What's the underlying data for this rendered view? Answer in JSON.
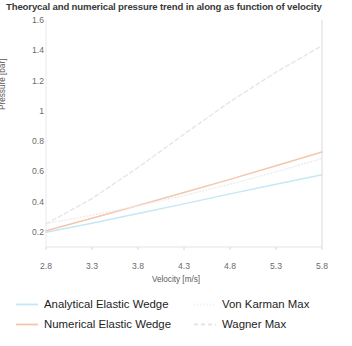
{
  "chart_data": {
    "type": "line",
    "title": "Theorycal and numerical pressure trend in along as function of velocity",
    "xlabel": "Velocity [m/s]",
    "ylabel": "Pressure [bar]",
    "xlim": [
      2.8,
      5.8
    ],
    "ylim": [
      0.1,
      1.6
    ],
    "xticks": [
      "2.8",
      "3.3",
      "3.8",
      "4.3",
      "4.8",
      "5.3",
      "5.8"
    ],
    "xtick_values": [
      2.8,
      3.3,
      3.8,
      4.3,
      4.8,
      5.3,
      5.8
    ],
    "yticks": [
      "0.2",
      "0.4",
      "0.6",
      "0.8",
      "1",
      "1.2",
      "1.4",
      "1.6"
    ],
    "ytick_values": [
      0.2,
      0.4,
      0.6,
      0.8,
      1.0,
      1.2,
      1.4,
      1.6
    ],
    "grid": false,
    "legend_position": "bottom",
    "x": [
      2.8,
      3.3,
      3.8,
      4.3,
      4.8,
      5.3,
      5.8
    ],
    "series": [
      {
        "name": "Analytical Elastic Wedge",
        "color": "#c6e7f5",
        "style": "solid",
        "values": [
          0.197,
          0.257,
          0.321,
          0.385,
          0.451,
          0.515,
          0.578
        ]
      },
      {
        "name": "Numerical Elastic Wedge",
        "color": "#f3c7ad",
        "style": "solid",
        "values": [
          0.208,
          0.29,
          0.374,
          0.46,
          0.547,
          0.637,
          0.728
        ]
      },
      {
        "name": "Von Karman Max",
        "color": "#ededed",
        "style": "dotted",
        "values": [
          0.255,
          0.31,
          0.372,
          0.44,
          0.515,
          0.597,
          0.685
        ]
      },
      {
        "name": "Wagner Max",
        "color": "#e6e6e6",
        "style": "dashed",
        "values": [
          0.252,
          0.42,
          0.625,
          0.845,
          1.06,
          1.255,
          1.43
        ]
      }
    ]
  },
  "legend": {
    "items": [
      {
        "label": "Analytical Elastic Wedge"
      },
      {
        "label": "Numerical Elastic Wedge"
      },
      {
        "label": "Von Karman Max"
      },
      {
        "label": "Wagner Max"
      }
    ]
  }
}
